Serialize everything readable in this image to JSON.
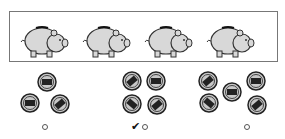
{
  "question": {
    "pig_count": 4,
    "pig_icon": "piggy-bank-icon"
  },
  "options": [
    {
      "coin_count": 3,
      "selected": false
    },
    {
      "coin_count": 4,
      "selected": true
    },
    {
      "coin_count": 5,
      "selected": false
    }
  ],
  "check_mark": "✔",
  "colors": {
    "pig_fill": "#d8d8d8",
    "outline": "#333333",
    "coin_fill": "#c8c8c8"
  }
}
